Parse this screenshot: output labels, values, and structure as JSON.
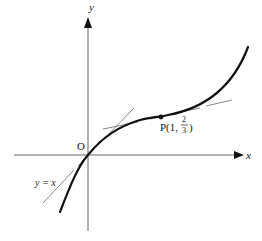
{
  "diagram": {
    "type": "function-graph",
    "axes": {
      "x_label": "x",
      "y_label": "y",
      "origin_label": "O"
    },
    "curve": {
      "description": "cubic-like increasing curve through origin with inflection near P",
      "color": "#111111"
    },
    "point": {
      "name": "P",
      "label_prefix": "P(1, ",
      "frac_num": "2",
      "frac_den": "3",
      "label_suffix": ")"
    },
    "tangents": [
      {
        "at": "O",
        "label": "y = x",
        "style": "dashed"
      },
      {
        "at": "P",
        "label": "",
        "style": "dashed"
      }
    ],
    "colors": {
      "axis": "#555555",
      "curve": "#111111",
      "tangent": "#777777",
      "text": "#222222"
    }
  }
}
